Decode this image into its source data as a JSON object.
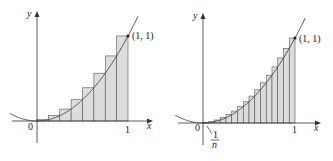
{
  "chart_data": [
    {
      "type": "bar",
      "title": "",
      "description": "Right-endpoint Riemann sum approximating area under y = x^2 on [0,1], n = 8",
      "function": "y = x^2",
      "n": 8,
      "x": [
        0.125,
        0.25,
        0.375,
        0.5,
        0.625,
        0.75,
        0.875,
        1.0
      ],
      "values": [
        0.015625,
        0.0625,
        0.140625,
        0.25,
        0.390625,
        0.5625,
        0.765625,
        1.0
      ],
      "xlabel": "x",
      "ylabel": "y",
      "xlim": [
        0,
        1
      ],
      "ylim": [
        0,
        1
      ],
      "tick_labels": [
        "0",
        "1"
      ],
      "annotations": [
        "(1, 1)"
      ],
      "grid": false
    },
    {
      "type": "bar",
      "title": "",
      "description": "Right-endpoint Riemann sum approximating area under y = x^2 on [0,1], n = 16",
      "function": "y = x^2",
      "n": 16,
      "x": [
        0.0625,
        0.125,
        0.1875,
        0.25,
        0.3125,
        0.375,
        0.4375,
        0.5,
        0.5625,
        0.625,
        0.6875,
        0.75,
        0.8125,
        0.875,
        0.9375,
        1.0
      ],
      "values": [
        0.0039,
        0.0156,
        0.0352,
        0.0625,
        0.0977,
        0.1406,
        0.1914,
        0.25,
        0.3164,
        0.3906,
        0.4727,
        0.5625,
        0.6602,
        0.7656,
        0.8789,
        1.0
      ],
      "xlabel": "x",
      "ylabel": "y",
      "xlim": [
        0,
        1
      ],
      "ylim": [
        0,
        1
      ],
      "tick_labels": [
        "0",
        "1"
      ],
      "annotations": [
        "(1, 1)",
        "1/n"
      ],
      "grid": false
    }
  ],
  "left": {
    "ylabel": "y",
    "xlabel": "x",
    "origin": "0",
    "one": "1",
    "point": "(1, 1)"
  },
  "right": {
    "ylabel": "y",
    "xlabel": "x",
    "origin": "0",
    "one": "1",
    "point": "(1, 1)",
    "frac_num": "1",
    "frac_den": "n"
  },
  "colors": {
    "fill": "#dcdcdc",
    "stroke": "#555555",
    "axis": "#333333"
  }
}
